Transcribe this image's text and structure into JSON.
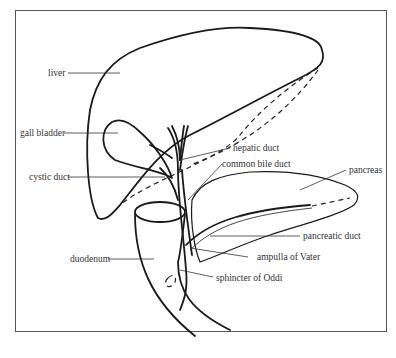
{
  "diagram": {
    "title": "",
    "labels": {
      "liver": "liver",
      "gall_bladder": "gall bladder",
      "cystic_duct": "cystic duct",
      "duodenum": "duodenum",
      "hepatic_duct": "hepatic duct",
      "common_bile_duct": "common bile duct",
      "pancreas": "pancreas",
      "pancreatic_duct": "pancreatic duct",
      "ampulla_of_vater": "ampulla of Vater",
      "sphincter_of_oddi": "sphincter of Oddi"
    }
  }
}
